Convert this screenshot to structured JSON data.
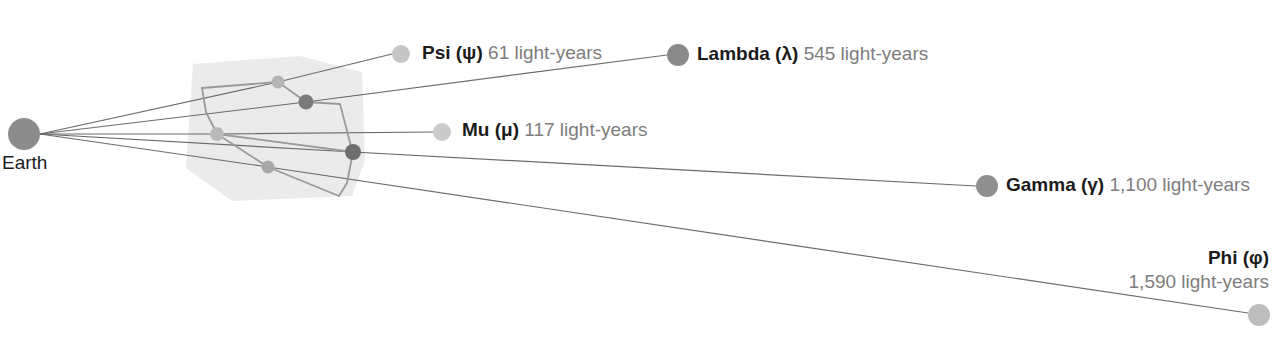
{
  "diagram": {
    "type": "constellation-distance-diagram",
    "background": "#ffffff",
    "observer": {
      "label": "Earth",
      "cx": 24,
      "cy": 134,
      "r": 16,
      "color": "#8c8c8c",
      "label_x": 2,
      "label_y": 152
    },
    "constellation_region": {
      "fill": "#ebebeb",
      "points": "193,64 300,56 362,72 365,160 352,196 232,201 186,168"
    },
    "constellation_stars": [
      {
        "name": "star-upper-left",
        "cx": 278,
        "cy": 82,
        "r": 6.5,
        "color": "#b3b3b3"
      },
      {
        "name": "star-upper-right",
        "cx": 306,
        "cy": 102,
        "r": 7.5,
        "color": "#7a7a7a"
      },
      {
        "name": "star-left",
        "cx": 217,
        "cy": 134,
        "r": 7,
        "color": "#b9b9b9"
      },
      {
        "name": "star-lower",
        "cx": 268,
        "cy": 167,
        "r": 6.5,
        "color": "#a8a8a8"
      },
      {
        "name": "star-hub",
        "cx": 353,
        "cy": 152,
        "r": 8,
        "color": "#6e6e6e"
      }
    ],
    "constellation_lines": [
      "202,88 278,82",
      "278,82 306,102",
      "306,102 340,104 352,150",
      "353,152 347,183 339,196",
      "339,196 268,167",
      "268,167 217,134",
      "217,134 206,112 202,88",
      "217,134 353,152"
    ],
    "constellation_line_color": "#9a9a9a",
    "sight_line_color": "#6b6b6b",
    "stars": [
      {
        "id": "psi",
        "name": "Psi (ψ)",
        "distance": "61 light-years",
        "dot": {
          "cx": 401,
          "cy": 54,
          "r": 9,
          "color": "#c6c6c6"
        },
        "label_x": 422,
        "label_y": 42,
        "sight_line": "40,134 278,82 392,54",
        "align": "left"
      },
      {
        "id": "lambda",
        "name": "Lambda (λ)",
        "distance": "545 light-years",
        "dot": {
          "cx": 678,
          "cy": 55,
          "r": 11,
          "color": "#8a8a8a"
        },
        "label_x": 697,
        "label_y": 43,
        "sight_line": "40,134 306,102 667,55",
        "align": "left"
      },
      {
        "id": "mu",
        "name": "Mu (μ)",
        "distance": "117 light-years",
        "dot": {
          "cx": 442,
          "cy": 132,
          "r": 9,
          "color": "#cacaca"
        },
        "label_x": 462,
        "label_y": 119,
        "sight_line": "40,134 217,134 433,132",
        "align": "left"
      },
      {
        "id": "gamma",
        "name": "Gamma (γ)",
        "distance": "1,100 light-years",
        "dot": {
          "cx": 987,
          "cy": 186,
          "r": 11,
          "color": "#8f8f8f"
        },
        "label_x": 1006,
        "label_y": 174,
        "sight_line": "40,134 353,152 976,186",
        "align": "left"
      },
      {
        "id": "phi",
        "name": "Phi (φ)",
        "distance": "1,590 light-years",
        "dot": {
          "cx": 1259,
          "cy": 315,
          "r": 11,
          "color": "#bdbdbd"
        },
        "label_x": 1269,
        "label_y": 246,
        "sight_line": "40,134 268,167 1248,313",
        "align": "right"
      }
    ]
  }
}
